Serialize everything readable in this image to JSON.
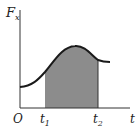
{
  "diagram": {
    "type": "force-time graph with shaded impulse area",
    "y_axis_label": "F",
    "y_axis_subscript": "x",
    "x_axis_label": "t",
    "origin_label": "O",
    "markers": [
      {
        "label": "t",
        "subscript": "1"
      },
      {
        "label": "t",
        "subscript": "2"
      }
    ],
    "shaded_region": "area under curve between t1 and t2",
    "colors": {
      "axis": "#333333",
      "curve": "#1a1a1a",
      "shade": "#8c8c8c",
      "background": "#ffffff"
    }
  }
}
